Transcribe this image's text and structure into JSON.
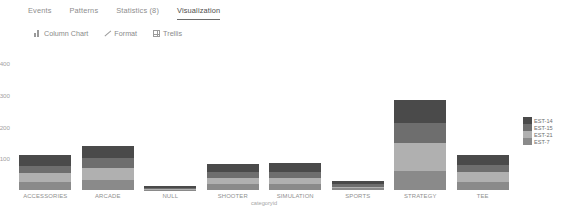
{
  "tabs": [
    {
      "label": "Events",
      "active": false
    },
    {
      "label": "Patterns",
      "active": false
    },
    {
      "label": "Statistics (8)",
      "active": false
    },
    {
      "label": "Visualization",
      "active": true
    }
  ],
  "toolbar": {
    "chart_type_label": "Column Chart",
    "chart_type_icon": "bar-chart-icon",
    "format_label": "Format",
    "format_icon": "pencil-icon",
    "trellis_label": "Trellis",
    "trellis_icon": "grid-icon"
  },
  "chart_data": {
    "type": "bar",
    "title": "",
    "xlabel": "categoryid",
    "ylabel": "",
    "stacked": true,
    "grid": false,
    "legend_position": "right",
    "ylim": [
      0,
      400
    ],
    "yticks": [
      400,
      300,
      200,
      100
    ],
    "categories": [
      "ACCESSORIES",
      "ARCADE",
      "NULL",
      "SHOOTER",
      "SIMULATION",
      "SPORTS",
      "STRATEGY",
      "TEE"
    ],
    "series": [
      {
        "name": "EST-14",
        "color": "#4a4a4a",
        "values": [
          34,
          40,
          5,
          26,
          27,
          10,
          72,
          32
        ]
      },
      {
        "name": "EST-15",
        "color": "#6e6e6e",
        "values": [
          22,
          32,
          4,
          18,
          20,
          7,
          62,
          22
        ]
      },
      {
        "name": "EST-21",
        "color": "#b0b0b0",
        "values": [
          28,
          36,
          2,
          20,
          20,
          6,
          88,
          30
        ]
      },
      {
        "name": "EST-7",
        "color": "#8a8a8a",
        "values": [
          26,
          32,
          1,
          18,
          18,
          5,
          60,
          26
        ]
      }
    ],
    "totals": [
      110,
      140,
      12,
      82,
      85,
      28,
      282,
      110
    ]
  },
  "colors": {
    "axis_text": "#a2a2a2",
    "category_text": "#8f8f8f",
    "active_tab": "#4c4c4c",
    "inactive_tab": "#8d8d8d"
  }
}
